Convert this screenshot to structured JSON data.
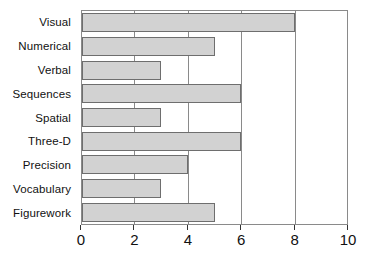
{
  "chart_data": {
    "type": "bar",
    "orientation": "horizontal",
    "title": "",
    "xlabel": "",
    "ylabel": "",
    "categories": [
      "Visual",
      "Numerical",
      "Verbal",
      "Sequences",
      "Spatial",
      "Three-D",
      "Precision",
      "Vocabulary",
      "Figurework"
    ],
    "values": [
      8,
      5,
      3,
      6,
      3,
      6,
      4,
      3,
      5
    ],
    "xlim": [
      0,
      10
    ],
    "xticks": [
      0,
      2,
      4,
      6,
      8,
      10
    ],
    "xtick_labels": [
      "0",
      "2",
      "4",
      "6",
      "8",
      "10"
    ],
    "grid": true,
    "legend": false,
    "bar_color": "#d2d2d2",
    "bar_border_color": "#6e6e6e",
    "axis_color": "#8a8a8a",
    "background_color": "#ffffff"
  }
}
